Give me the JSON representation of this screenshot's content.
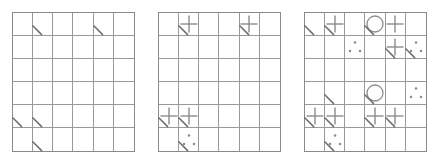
{
  "figure": {
    "panel_count": 3,
    "rows": 6,
    "columns": 6,
    "background_color": "#ffffff",
    "grid_line_color": "#9a9a9a",
    "grid_border_color": "#8a8a8a",
    "symbol_color": "#8c8c8c",
    "tick_color": "#6e6e6e"
  },
  "symbol_legend": {
    "plus": "plus-sign",
    "circle": "circle-outline",
    "dots": "three-dot-triangle",
    "tick": "corner-tick-mark",
    "empty": "empty-cell"
  },
  "panels": [
    {
      "name": "panel-1",
      "index": 1,
      "cells": [
        [
          {
            "sym": "empty",
            "tick": false
          },
          {
            "sym": "empty",
            "tick": true
          },
          {
            "sym": "empty",
            "tick": false
          },
          {
            "sym": "empty",
            "tick": false
          },
          {
            "sym": "empty",
            "tick": true
          },
          {
            "sym": "empty",
            "tick": false
          }
        ],
        [
          {
            "sym": "empty",
            "tick": false
          },
          {
            "sym": "empty",
            "tick": false
          },
          {
            "sym": "empty",
            "tick": false
          },
          {
            "sym": "empty",
            "tick": false
          },
          {
            "sym": "empty",
            "tick": false
          },
          {
            "sym": "empty",
            "tick": false
          }
        ],
        [
          {
            "sym": "empty",
            "tick": false
          },
          {
            "sym": "empty",
            "tick": false
          },
          {
            "sym": "empty",
            "tick": false
          },
          {
            "sym": "empty",
            "tick": false
          },
          {
            "sym": "empty",
            "tick": false
          },
          {
            "sym": "empty",
            "tick": false
          }
        ],
        [
          {
            "sym": "empty",
            "tick": false
          },
          {
            "sym": "empty",
            "tick": false
          },
          {
            "sym": "empty",
            "tick": false
          },
          {
            "sym": "empty",
            "tick": false
          },
          {
            "sym": "empty",
            "tick": false
          },
          {
            "sym": "empty",
            "tick": false
          }
        ],
        [
          {
            "sym": "empty",
            "tick": true
          },
          {
            "sym": "empty",
            "tick": true
          },
          {
            "sym": "empty",
            "tick": false
          },
          {
            "sym": "empty",
            "tick": false
          },
          {
            "sym": "empty",
            "tick": false
          },
          {
            "sym": "empty",
            "tick": false
          }
        ],
        [
          {
            "sym": "empty",
            "tick": false
          },
          {
            "sym": "empty",
            "tick": true
          },
          {
            "sym": "empty",
            "tick": false
          },
          {
            "sym": "empty",
            "tick": false
          },
          {
            "sym": "empty",
            "tick": false
          },
          {
            "sym": "empty",
            "tick": false
          }
        ]
      ]
    },
    {
      "name": "panel-2",
      "index": 2,
      "cells": [
        [
          {
            "sym": "empty",
            "tick": false
          },
          {
            "sym": "plus",
            "tick": true
          },
          {
            "sym": "empty",
            "tick": false
          },
          {
            "sym": "empty",
            "tick": false
          },
          {
            "sym": "plus",
            "tick": true
          },
          {
            "sym": "empty",
            "tick": false
          }
        ],
        [
          {
            "sym": "empty",
            "tick": false
          },
          {
            "sym": "empty",
            "tick": false
          },
          {
            "sym": "empty",
            "tick": false
          },
          {
            "sym": "empty",
            "tick": false
          },
          {
            "sym": "empty",
            "tick": false
          },
          {
            "sym": "empty",
            "tick": false
          }
        ],
        [
          {
            "sym": "empty",
            "tick": false
          },
          {
            "sym": "empty",
            "tick": false
          },
          {
            "sym": "empty",
            "tick": false
          },
          {
            "sym": "empty",
            "tick": false
          },
          {
            "sym": "empty",
            "tick": false
          },
          {
            "sym": "empty",
            "tick": false
          }
        ],
        [
          {
            "sym": "empty",
            "tick": false
          },
          {
            "sym": "empty",
            "tick": false
          },
          {
            "sym": "empty",
            "tick": false
          },
          {
            "sym": "empty",
            "tick": false
          },
          {
            "sym": "empty",
            "tick": false
          },
          {
            "sym": "empty",
            "tick": false
          }
        ],
        [
          {
            "sym": "plus",
            "tick": true
          },
          {
            "sym": "plus",
            "tick": true
          },
          {
            "sym": "empty",
            "tick": false
          },
          {
            "sym": "empty",
            "tick": false
          },
          {
            "sym": "empty",
            "tick": false
          },
          {
            "sym": "empty",
            "tick": false
          }
        ],
        [
          {
            "sym": "empty",
            "tick": false
          },
          {
            "sym": "dots",
            "tick": true
          },
          {
            "sym": "empty",
            "tick": false
          },
          {
            "sym": "empty",
            "tick": false
          },
          {
            "sym": "empty",
            "tick": false
          },
          {
            "sym": "empty",
            "tick": false
          }
        ]
      ]
    },
    {
      "name": "panel-3",
      "index": 3,
      "cells": [
        [
          {
            "sym": "empty",
            "tick": true
          },
          {
            "sym": "plus",
            "tick": true
          },
          {
            "sym": "empty",
            "tick": false
          },
          {
            "sym": "circle",
            "tick": true
          },
          {
            "sym": "plus",
            "tick": false
          },
          {
            "sym": "empty",
            "tick": false
          }
        ],
        [
          {
            "sym": "empty",
            "tick": false
          },
          {
            "sym": "empty",
            "tick": false
          },
          {
            "sym": "dots",
            "tick": false
          },
          {
            "sym": "empty",
            "tick": false
          },
          {
            "sym": "plus",
            "tick": true
          },
          {
            "sym": "dots",
            "tick": true
          }
        ],
        [
          {
            "sym": "empty",
            "tick": false
          },
          {
            "sym": "empty",
            "tick": false
          },
          {
            "sym": "empty",
            "tick": false
          },
          {
            "sym": "empty",
            "tick": false
          },
          {
            "sym": "empty",
            "tick": false
          },
          {
            "sym": "empty",
            "tick": false
          }
        ],
        [
          {
            "sym": "empty",
            "tick": false
          },
          {
            "sym": "empty",
            "tick": true
          },
          {
            "sym": "empty",
            "tick": false
          },
          {
            "sym": "circle",
            "tick": true
          },
          {
            "sym": "empty",
            "tick": false
          },
          {
            "sym": "dots",
            "tick": false
          }
        ],
        [
          {
            "sym": "plus",
            "tick": true
          },
          {
            "sym": "plus",
            "tick": true
          },
          {
            "sym": "empty",
            "tick": false
          },
          {
            "sym": "plus",
            "tick": true
          },
          {
            "sym": "plus",
            "tick": true
          },
          {
            "sym": "empty",
            "tick": false
          }
        ],
        [
          {
            "sym": "empty",
            "tick": false
          },
          {
            "sym": "dots",
            "tick": true
          },
          {
            "sym": "empty",
            "tick": false
          },
          {
            "sym": "empty",
            "tick": false
          },
          {
            "sym": "empty",
            "tick": false
          },
          {
            "sym": "empty",
            "tick": false
          }
        ]
      ]
    }
  ]
}
